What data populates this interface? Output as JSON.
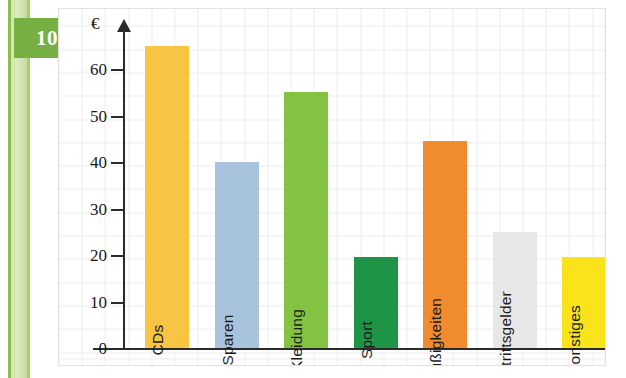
{
  "sidebar": {
    "chapter_badge": "10"
  },
  "chart_data": {
    "type": "bar",
    "title": "",
    "xlabel": "",
    "ylabel": "€",
    "ylim": [
      0,
      70
    ],
    "yticks": [
      0,
      10,
      20,
      30,
      40,
      50,
      60
    ],
    "ytick_labels": [
      "0",
      "10",
      "20",
      "30",
      "40",
      "50",
      "60"
    ],
    "grid": true,
    "legend": "none",
    "categories": [
      "CDs",
      "Sparen",
      "Kleidung",
      "Sport",
      "Süßigkeiten",
      "Eintrittsgelder",
      "Sonstiges"
    ],
    "values": [
      65,
      40,
      55,
      19.5,
      44.5,
      25,
      19.5
    ],
    "colors": [
      "#f6c githubusercontent"
    ]
  },
  "bars": [
    {
      "label": "CDs",
      "value": 65,
      "color": "#f7c443"
    },
    {
      "label": "Sparen",
      "value": 40,
      "color": "#a8c4dd"
    },
    {
      "label": "Kleidung",
      "value": 55,
      "color": "#82c341"
    },
    {
      "label": "Sport",
      "value": 19.5,
      "color": "#1e9447"
    },
    {
      "label": "Süßigkeiten",
      "value": 44.5,
      "color": "#f08c2e"
    },
    {
      "label": "Eintrittsgelder",
      "value": 25,
      "color": "#e7e7e7"
    },
    {
      "label": "Sonstiges",
      "value": 19.5,
      "color": "#f9e41c"
    }
  ],
  "axis": {
    "euro_symbol": "€",
    "labels": [
      "60",
      "50",
      "40",
      "30",
      "20",
      "10",
      "0"
    ]
  }
}
